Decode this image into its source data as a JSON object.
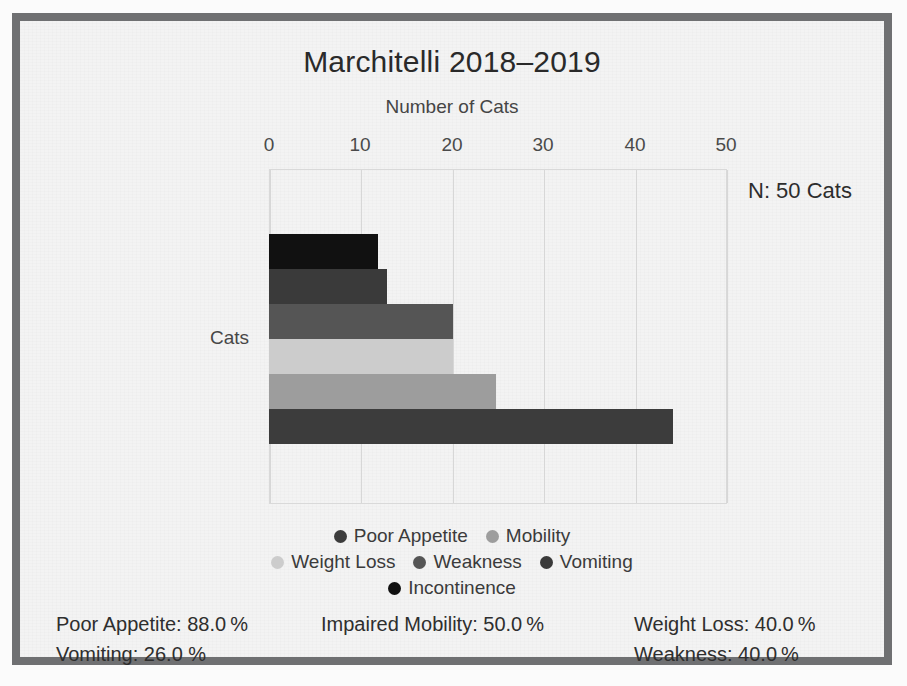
{
  "figure": {
    "title": "Marchitelli 2018–2019",
    "background_color": "#f3f3f3",
    "frame_color": "#6f7072"
  },
  "annotation": {
    "sample_size_label": "N: 50 Cats"
  },
  "category_label": "Cats",
  "chart_data": {
    "type": "bar",
    "orientation": "horizontal",
    "title": "Marchitelli 2018–2019",
    "xlabel": "Number of Cats",
    "ylabel": "Cats",
    "xlim": [
      0,
      55
    ],
    "xticks": [
      0,
      10,
      20,
      30,
      40,
      50
    ],
    "xtick_labels": [
      "0",
      "10",
      "20",
      "30",
      "40",
      "50"
    ],
    "grid": true,
    "legend_position": "bottom",
    "categories": [
      "Cats"
    ],
    "series": [
      {
        "name": "Incontinence",
        "values": [
          12
        ],
        "color": "#111111"
      },
      {
        "name": "Vomiting",
        "values": [
          13
        ],
        "color": "#3a3a3a"
      },
      {
        "name": "Weakness",
        "values": [
          20
        ],
        "color": "#555555"
      },
      {
        "name": "Weight Loss",
        "values": [
          20
        ],
        "color": "#cccccc"
      },
      {
        "name": "Mobility",
        "values": [
          25
        ],
        "color": "#9d9d9d"
      },
      {
        "name": "Poor Appetite",
        "values": [
          44
        ],
        "color": "#3c3c3c"
      }
    ],
    "annotations": [
      "N: 50 Cats"
    ]
  },
  "xticks": [
    {
      "label": "0",
      "x": 0
    },
    {
      "label": "10",
      "x": 91
    },
    {
      "label": "20",
      "x": 183
    },
    {
      "label": "30",
      "x": 274
    },
    {
      "label": "40",
      "x": 366
    },
    {
      "label": "50",
      "x": 457
    }
  ],
  "bars": [
    {
      "name": "Incontinence",
      "value": 12,
      "width_px": 109,
      "top_px": 0,
      "color": "#111111"
    },
    {
      "name": "Vomiting",
      "value": 13,
      "width_px": 118,
      "top_px": 35,
      "color": "#3a3a3a"
    },
    {
      "name": "Weakness",
      "value": 20,
      "width_px": 184,
      "top_px": 70,
      "color": "#555555"
    },
    {
      "name": "Weight Loss",
      "value": 20,
      "width_px": 184,
      "top_px": 105,
      "color": "#cccccc"
    },
    {
      "name": "Mobility",
      "value": 25,
      "width_px": 227,
      "top_px": 140,
      "color": "#9d9d9d"
    },
    {
      "name": "Poor Appetite",
      "value": 44,
      "width_px": 404,
      "top_px": 175,
      "color": "#3c3c3c"
    }
  ],
  "legend": {
    "rows": [
      [
        {
          "label": "Poor Appetite",
          "color": "#3c3c3c"
        },
        {
          "label": "Mobility",
          "color": "#9d9d9d"
        }
      ],
      [
        {
          "label": "Weight Loss",
          "color": "#cccccc"
        },
        {
          "label": "Weakness",
          "color": "#555555"
        },
        {
          "label": "Vomiting",
          "color": "#3a3a3a"
        }
      ],
      [
        {
          "label": "Incontinence",
          "color": "#111111"
        }
      ]
    ]
  },
  "stats": {
    "rows": [
      [
        "Poor Appetite: 88.0 %",
        "Impaired Mobility: 50.0 %",
        "Weight Loss: 40.0 %"
      ],
      [
        "Vomiting: 26.0 %",
        "",
        "Weakness: 40.0 %"
      ]
    ]
  }
}
